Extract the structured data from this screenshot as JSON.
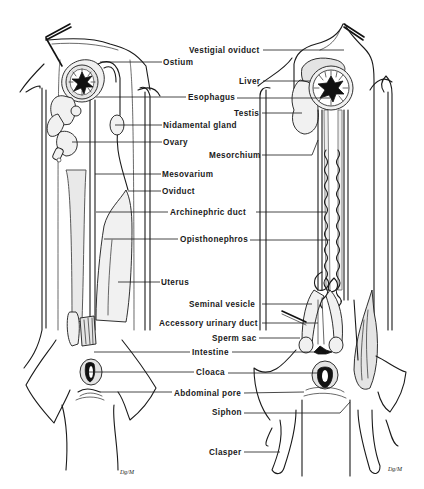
{
  "figure": {
    "specimens": [
      {
        "id": "female",
        "side": "left"
      },
      {
        "id": "male",
        "side": "right"
      }
    ],
    "signature": "Dg/M"
  },
  "labels": {
    "female": [
      {
        "key": "ostium",
        "text": "Ostium",
        "x": 163,
        "y": 64
      },
      {
        "key": "esophagus",
        "text": "Esophagus",
        "x": 187,
        "y": 99
      },
      {
        "key": "nidamental_gland",
        "text": "Nidamental gland",
        "x": 163,
        "y": 127
      },
      {
        "key": "ovary",
        "text": "Ovary",
        "x": 163,
        "y": 144
      },
      {
        "key": "mesovarium",
        "text": "Mesovarium",
        "x": 162,
        "y": 176
      },
      {
        "key": "oviduct",
        "text": "Oviduct",
        "x": 162,
        "y": 193
      },
      {
        "key": "archinephric_duct",
        "text": "Archinephric duct",
        "x": 170,
        "y": 214
      },
      {
        "key": "opisthonephros",
        "text": "Opisthonephros",
        "x": 180,
        "y": 241
      },
      {
        "key": "uterus",
        "text": "Uterus",
        "x": 161,
        "y": 284
      },
      {
        "key": "intestine",
        "text": "Intestine",
        "x": 192,
        "y": 354
      },
      {
        "key": "cloaca",
        "text": "Cloaca",
        "x": 196,
        "y": 374
      },
      {
        "key": "abdominal_pore",
        "text": "Abdominal pore",
        "x": 174,
        "y": 395
      }
    ],
    "male": [
      {
        "key": "vestigial_oviduct",
        "text": "Vestigial oviduct",
        "x": 190,
        "y": 52
      },
      {
        "key": "liver",
        "text": "Liver",
        "x": 239,
        "y": 83
      },
      {
        "key": "testis",
        "text": "Testis",
        "x": 235,
        "y": 115
      },
      {
        "key": "mesorchium",
        "text": "Mesorchium",
        "x": 210,
        "y": 157
      },
      {
        "key": "archinephric_duct",
        "text": "Archinephric duct",
        "x": 170,
        "y": 214
      },
      {
        "key": "opisthonephros",
        "text": "Opisthonephros",
        "x": 180,
        "y": 241
      },
      {
        "key": "seminal_vesicle",
        "text": "Seminal vesicle",
        "x": 189,
        "y": 306
      },
      {
        "key": "accessory_urinary_duct",
        "text": "Accessory urinary duct",
        "x": 159,
        "y": 325
      },
      {
        "key": "sperm_sac",
        "text": "Sperm sac",
        "x": 212,
        "y": 340
      },
      {
        "key": "intestine",
        "text": "Intestine",
        "x": 192,
        "y": 354
      },
      {
        "key": "cloaca",
        "text": "Cloaca",
        "x": 196,
        "y": 374
      },
      {
        "key": "abdominal_pore",
        "text": "Abdominal pore",
        "x": 174,
        "y": 395
      },
      {
        "key": "siphon",
        "text": "Siphon",
        "x": 212,
        "y": 414
      },
      {
        "key": "clasper",
        "text": "Clasper",
        "x": 209,
        "y": 454
      }
    ]
  },
  "shared_labels": [
    {
      "name": "label-ostium",
      "text": "Ostium",
      "x": 163,
      "y": 64,
      "line": [
        [
          100,
          62
        ],
        [
          162,
          62
        ]
      ]
    },
    {
      "name": "label-vestigial-oviduct",
      "text": "Vestigial oviduct",
      "x": 190,
      "y": 52,
      "line": [
        [
          262,
          50
        ],
        [
          344,
          50
        ]
      ]
    },
    {
      "name": "label-liver",
      "text": "Liver",
      "x": 239,
      "y": 83,
      "line": [
        [
          262,
          81
        ],
        [
          310,
          81
        ],
        [
          262,
          81
        ],
        [
          258,
          87
        ]
      ]
    },
    {
      "name": "label-esophagus",
      "text": "Esophagus",
      "x": 187,
      "y": 99,
      "line": [
        [
          96,
          97
        ],
        [
          186,
          97
        ],
        [
          237,
          97
        ],
        [
          330,
          98
        ]
      ]
    },
    {
      "name": "label-testis",
      "text": "Testis",
      "x": 235,
      "y": 115,
      "line": [
        [
          262,
          113
        ],
        [
          302,
          113
        ]
      ]
    },
    {
      "name": "label-nidamental-gland",
      "text": "Nidamental gland",
      "x": 163,
      "y": 127,
      "line": [
        [
          115,
          125
        ],
        [
          162,
          125
        ]
      ]
    },
    {
      "name": "label-ovary",
      "text": "Ovary",
      "x": 163,
      "y": 144,
      "line": [
        [
          72,
          142
        ],
        [
          162,
          142
        ]
      ]
    },
    {
      "name": "label-mesorchium",
      "text": "Mesorchium",
      "x": 210,
      "y": 157,
      "line": [
        [
          262,
          155
        ],
        [
          310,
          155
        ],
        [
          318,
          140
        ]
      ]
    },
    {
      "name": "label-mesovarium",
      "text": "Mesovarium",
      "x": 162,
      "y": 176,
      "line": [
        [
          95,
          174
        ],
        [
          161,
          174
        ]
      ]
    },
    {
      "name": "label-oviduct",
      "text": "Oviduct",
      "x": 162,
      "y": 193,
      "line": [
        [
          128,
          191
        ],
        [
          161,
          191
        ]
      ]
    },
    {
      "name": "label-archinephric-duct",
      "text": "Archinephric duct",
      "x": 170,
      "y": 214,
      "line": [
        [
          96,
          212
        ],
        [
          168,
          212
        ],
        [
          256,
          212
        ],
        [
          318,
          212
        ]
      ]
    },
    {
      "name": "label-opisthonephros",
      "text": "Opisthonephros",
      "x": 180,
      "y": 241,
      "line": [
        [
          104,
          239
        ],
        [
          178,
          239
        ],
        [
          250,
          240
        ],
        [
          318,
          240
        ]
      ]
    },
    {
      "name": "label-uterus",
      "text": "Uterus",
      "x": 161,
      "y": 284,
      "line": [
        [
          118,
          282
        ],
        [
          160,
          282
        ]
      ]
    },
    {
      "name": "label-seminal-vesicle",
      "text": "Seminal vesicle",
      "x": 189,
      "y": 306,
      "line": [
        [
          262,
          304
        ],
        [
          310,
          304
        ]
      ]
    },
    {
      "name": "label-accessory-urinary-duct",
      "text": "Accessory urinary duct",
      "x": 159,
      "y": 325,
      "line": [
        [
          262,
          323
        ],
        [
          318,
          323
        ]
      ]
    },
    {
      "name": "label-sperm-sac",
      "text": "Sperm sac",
      "x": 212,
      "y": 340,
      "line": [
        [
          259,
          338
        ],
        [
          300,
          338
        ]
      ]
    },
    {
      "name": "label-intestine",
      "text": "Intestine",
      "x": 192,
      "y": 354,
      "line": [
        [
          94,
          352
        ],
        [
          190,
          352
        ],
        [
          232,
          352
        ],
        [
          330,
          352
        ]
      ]
    },
    {
      "name": "label-cloaca",
      "text": "Cloaca",
      "x": 196,
      "y": 374,
      "line": [
        [
          86,
          372
        ],
        [
          194,
          372
        ],
        [
          228,
          373
        ],
        [
          318,
          373
        ]
      ]
    },
    {
      "name": "label-abdominal-pore",
      "text": "Abdominal pore",
      "x": 174,
      "y": 395,
      "line": [
        [
          100,
          392
        ],
        [
          172,
          392
        ],
        [
          244,
          393
        ],
        [
          300,
          392
        ]
      ]
    },
    {
      "name": "label-siphon",
      "text": "Siphon",
      "x": 212,
      "y": 414,
      "line": [
        [
          244,
          413
        ],
        [
          340,
          413
        ],
        [
          350,
          402
        ]
      ]
    },
    {
      "name": "label-clasper",
      "text": "Clasper",
      "x": 209,
      "y": 454,
      "line": [
        [
          244,
          452
        ],
        [
          278,
          452
        ]
      ]
    }
  ]
}
